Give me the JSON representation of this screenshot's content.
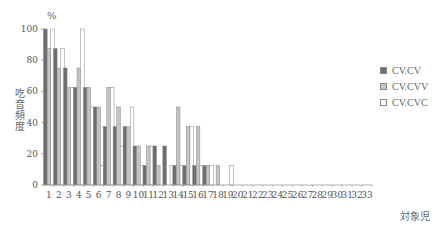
{
  "chart_data": {
    "type": "bar",
    "title": "",
    "xlabel": "対象児",
    "ylabel": "吃音頻度",
    "yunit": "%",
    "ylim": [
      0,
      100
    ],
    "yticks": [
      0,
      20,
      40,
      60,
      80,
      100
    ],
    "grid": false,
    "legend_position": "right",
    "categories": [
      "1",
      "2",
      "3",
      "4",
      "5",
      "6",
      "7",
      "8",
      "9",
      "10",
      "11",
      "12",
      "13",
      "14",
      "15",
      "16",
      "17",
      "18",
      "19",
      "20",
      "21",
      "22",
      "23",
      "24",
      "25",
      "26",
      "27",
      "28",
      "29",
      "30",
      "31",
      "32",
      "33"
    ],
    "series": [
      {
        "name": "CV.CV",
        "color": "#6e6e6e",
        "values": [
          100,
          87.5,
          75,
          62.5,
          62.5,
          50,
          37.5,
          37.5,
          37.5,
          25,
          12.5,
          25,
          25,
          12.5,
          12.5,
          12.5,
          12.5,
          0,
          0,
          0,
          0,
          0,
          0,
          0,
          0,
          0,
          0,
          0,
          0,
          0,
          0,
          0,
          0
        ]
      },
      {
        "name": "CV.CVV",
        "color": "#c4c4c4",
        "values": [
          87.5,
          75,
          62.5,
          75,
          62.5,
          50,
          62.5,
          50,
          37.5,
          25,
          25,
          12.5,
          0,
          50,
          37.5,
          37.5,
          12.5,
          12.5,
          0,
          0,
          0,
          0,
          0,
          0,
          0,
          0,
          0,
          0,
          0,
          0,
          0,
          0,
          0
        ]
      },
      {
        "name": "CV.CVC",
        "color": "#ffffff",
        "values": [
          100,
          87.5,
          62.5,
          100,
          50,
          12.5,
          62.5,
          25,
          50,
          12.5,
          25,
          0,
          12.5,
          12.5,
          37.5,
          12.5,
          12.5,
          0,
          12.5,
          0,
          0,
          0,
          0,
          0,
          0,
          0,
          0,
          0,
          0,
          0,
          0,
          0,
          0
        ]
      }
    ]
  },
  "legend": {
    "items": [
      {
        "label": "CV.CV",
        "color": "#6e6e6e"
      },
      {
        "label": "CV.CVV",
        "color": "#c4c4c4"
      },
      {
        "label": "CV.CVC",
        "color": "#ffffff"
      }
    ]
  }
}
